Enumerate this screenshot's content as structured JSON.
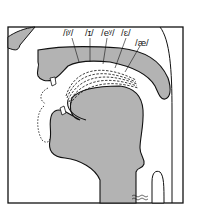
{
  "figure": {
    "type": "midsagittal vocal tract diagram",
    "colors": {
      "tissue_fill": "#b3b3b3",
      "outline": "#111111",
      "background": "#ffffff"
    }
  },
  "labels": [
    {
      "id": "iy",
      "text": "/iʸ/"
    },
    {
      "id": "ih",
      "text": "/ɪ/"
    },
    {
      "id": "ey",
      "text": "/eʸ/"
    },
    {
      "id": "eh",
      "text": "/ɛ/"
    },
    {
      "id": "ae",
      "text": "/æ/"
    }
  ]
}
